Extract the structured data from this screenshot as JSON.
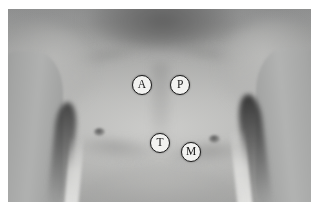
{
  "figure": {
    "photo_alt": "Grayscale photograph of a bare male torso from neck to upper abdomen, arms at sides",
    "border_color": "#ffffff",
    "photo_bg_color": "#a2a3a2"
  },
  "markers": {
    "outline_color": "#1b1b1b",
    "fill_color": "#f2f2f0",
    "label_color": "#141414",
    "items": [
      {
        "id": "aortic",
        "label": "A",
        "name": "Aortic area",
        "x_pct": 44.2,
        "y_pct": 39.4
      },
      {
        "id": "pulmonic",
        "label": "P",
        "name": "Pulmonic area",
        "x_pct": 56.8,
        "y_pct": 39.4
      },
      {
        "id": "tricuspid",
        "label": "T",
        "name": "Tricuspid area",
        "x_pct": 50.2,
        "y_pct": 69.4
      },
      {
        "id": "mitral",
        "label": "M",
        "name": "Mitral area",
        "x_pct": 60.4,
        "y_pct": 74.1
      }
    ]
  }
}
